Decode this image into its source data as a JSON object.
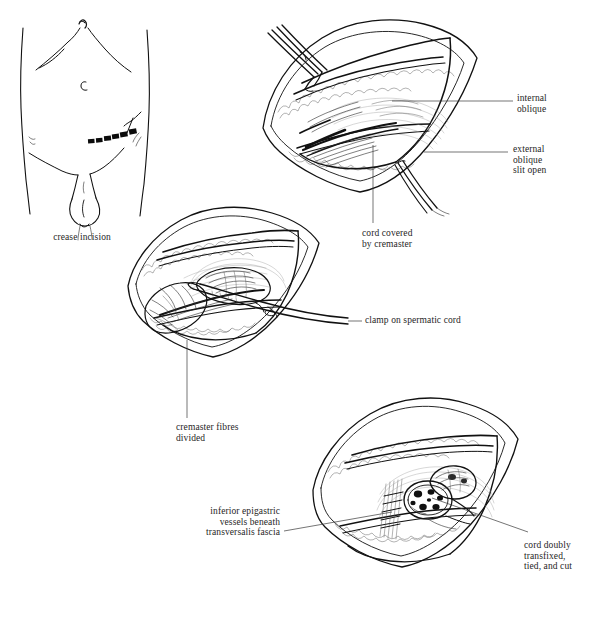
{
  "plate": {
    "title": "Inguinal herniotomy / orchidectomy operative sequence",
    "background_color": "#ffffff",
    "ink_color": "#111111",
    "text_color": "#262626",
    "width": 589,
    "height": 620
  },
  "figures": [
    {
      "id": "fig-1",
      "name": "crease-incision-body-diagram",
      "caption": "crease incision",
      "description": "Anterior view of lower abdomen, groin and scrotum with a skin crease incision marked as a row of solid dashes in the right groin"
    },
    {
      "id": "fig-2",
      "name": "external-oblique-opened",
      "description": "Opened inguinal wound with external oblique aponeurosis slit, retracted by forceps, exposing cord covered by cremaster"
    },
    {
      "id": "fig-3",
      "name": "clamp-on-cord",
      "description": "Wound with cremaster fibres divided and a long clamp applied across the spermatic cord"
    },
    {
      "id": "fig-4",
      "name": "cord-transfixed-tied-cut",
      "description": "Wound showing cut end of the spermatic cord doubly transfixed and tied, with inferior epigastric vessels beneath transversalis fascia"
    }
  ],
  "labels": [
    {
      "id": "label-crease-incision",
      "name": "label-crease-incision",
      "text": "crease incision",
      "align": "center",
      "figure": "fig-1"
    },
    {
      "id": "label-internal-oblique",
      "name": "label-internal-oblique",
      "text": "internal\noblique",
      "align": "left",
      "figure": "fig-2"
    },
    {
      "id": "label-external-oblique-slit-open",
      "name": "label-external-oblique-slit-open",
      "text": "external\noblique\nslit open",
      "align": "left",
      "figure": "fig-2"
    },
    {
      "id": "label-cord-covered-by-cremaster",
      "name": "label-cord-covered-by-cremaster",
      "text": "cord covered\nby cremaster",
      "align": "left",
      "figure": "fig-2"
    },
    {
      "id": "label-clamp-on-spermatic-cord",
      "name": "label-clamp-on-spermatic-cord",
      "text": "clamp on spermatic cord",
      "align": "left",
      "figure": "fig-3"
    },
    {
      "id": "label-cremaster-fibres-divided",
      "name": "label-cremaster-fibres-divided",
      "text": "cremaster fibres\ndivided",
      "align": "left",
      "figure": "fig-3"
    },
    {
      "id": "label-inferior-epigastric",
      "name": "label-inferior-epigastric-vessels",
      "text": "inferior epigastric\nvessels beneath\ntransversalis fascia",
      "align": "right",
      "figure": "fig-4"
    },
    {
      "id": "label-cord-doubly-transfixed",
      "name": "label-cord-doubly-transfixed",
      "text": "cord doubly\ntransfixed,\ntied, and cut",
      "align": "left",
      "figure": "fig-4"
    }
  ]
}
